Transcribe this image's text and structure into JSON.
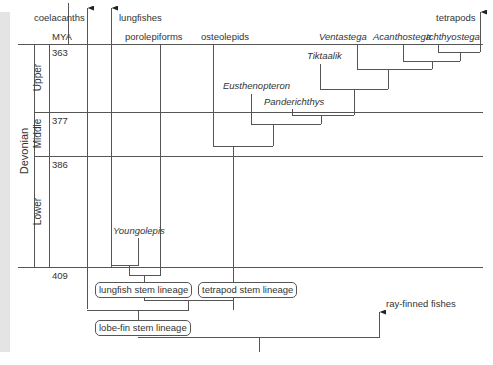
{
  "header": {
    "mya_label": "MYA"
  },
  "time_scale": {
    "period": "Devonian",
    "epochs": [
      {
        "name": "Upper",
        "start_mya": "363"
      },
      {
        "name": "Middle",
        "start_mya": "377"
      },
      {
        "name": "Lower",
        "start_mya": "386"
      }
    ],
    "base_mya": "409"
  },
  "clades": {
    "coelacanths": "coelacanths",
    "lungfishes": "lungfishes",
    "porolepiforms": "porolepiforms",
    "osteolepids": "osteolepids",
    "tetrapods": "tetrapods",
    "ray_finned": "ray-finned fishes"
  },
  "taxa": {
    "youngolepis": "Youngolepis",
    "eusthenopteron": "Eusthenopteron",
    "panderichthys": "Panderichthys",
    "tiktaalik": "Tiktaalik",
    "ventastega": "Ventastega",
    "acanthostega": "Acanthostega",
    "ichthyostega": "Ichthyostega"
  },
  "lineages": {
    "lungfish_stem": "lungfish stem lineage",
    "tetrapod_stem": "tetrapod stem lineage",
    "lobefin_stem": "lobe-fin stem lineage"
  },
  "colors": {
    "line": "#555555",
    "text": "#333333",
    "side_strip": "#e4e4e4"
  }
}
